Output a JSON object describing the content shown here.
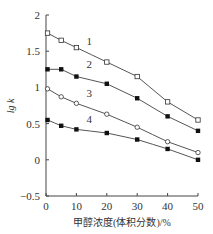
{
  "chart_data": {
    "type": "line",
    "title": "",
    "xlabel": "甲醇浓度(体积分数)/%",
    "ylabel": "lg k",
    "xlim": [
      0,
      50
    ],
    "ylim": [
      -0.5,
      2
    ],
    "xticks": [
      0,
      10,
      20,
      30,
      40,
      50
    ],
    "yticks": [
      -0.5,
      0,
      0.5,
      1,
      1.5,
      2
    ],
    "ytick_labels": [
      "−0.5",
      "0",
      "0.5",
      "1",
      "1.5",
      "2"
    ],
    "grid": false,
    "legend": "inline numeric labels 1-4",
    "x": [
      0,
      5,
      10,
      20,
      30,
      40,
      50
    ],
    "series": [
      {
        "name": "1",
        "marker": "open-square",
        "values": [
          1.75,
          1.65,
          1.55,
          1.35,
          1.15,
          0.8,
          0.55
        ]
      },
      {
        "name": "2",
        "marker": "filled-square",
        "values": [
          1.25,
          1.25,
          1.15,
          1.05,
          0.85,
          0.6,
          0.4
        ]
      },
      {
        "name": "3",
        "marker": "open-circle",
        "values": [
          0.98,
          0.87,
          0.78,
          0.63,
          0.45,
          0.25,
          0.1
        ]
      },
      {
        "name": "4",
        "marker": "filled-square",
        "values": [
          0.55,
          0.47,
          0.42,
          0.37,
          0.28,
          0.15,
          0.0
        ]
      }
    ]
  }
}
